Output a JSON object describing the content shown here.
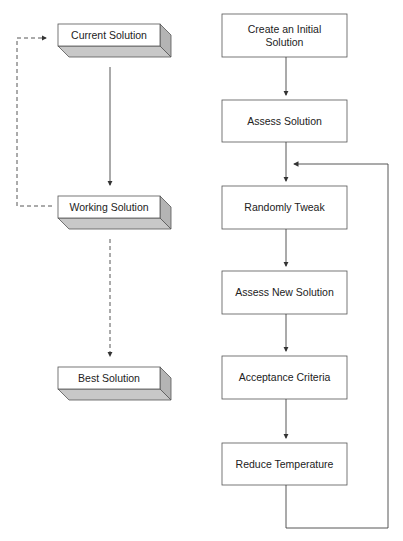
{
  "left_column": {
    "current_solution": "Current Solution",
    "working_solution": "Working Solution",
    "best_solution": "Best Solution"
  },
  "right_column": {
    "steps": [
      "Create an Initial Solution",
      "Assess Solution",
      "Randomly Tweak",
      "Assess New Solution",
      "Acceptance Criteria",
      "Reduce Temperature"
    ]
  },
  "colors": {
    "line": "#444444",
    "box_border": "#555555",
    "box_shade": "#c8c8c8",
    "box_side": "#b4b4b4"
  }
}
